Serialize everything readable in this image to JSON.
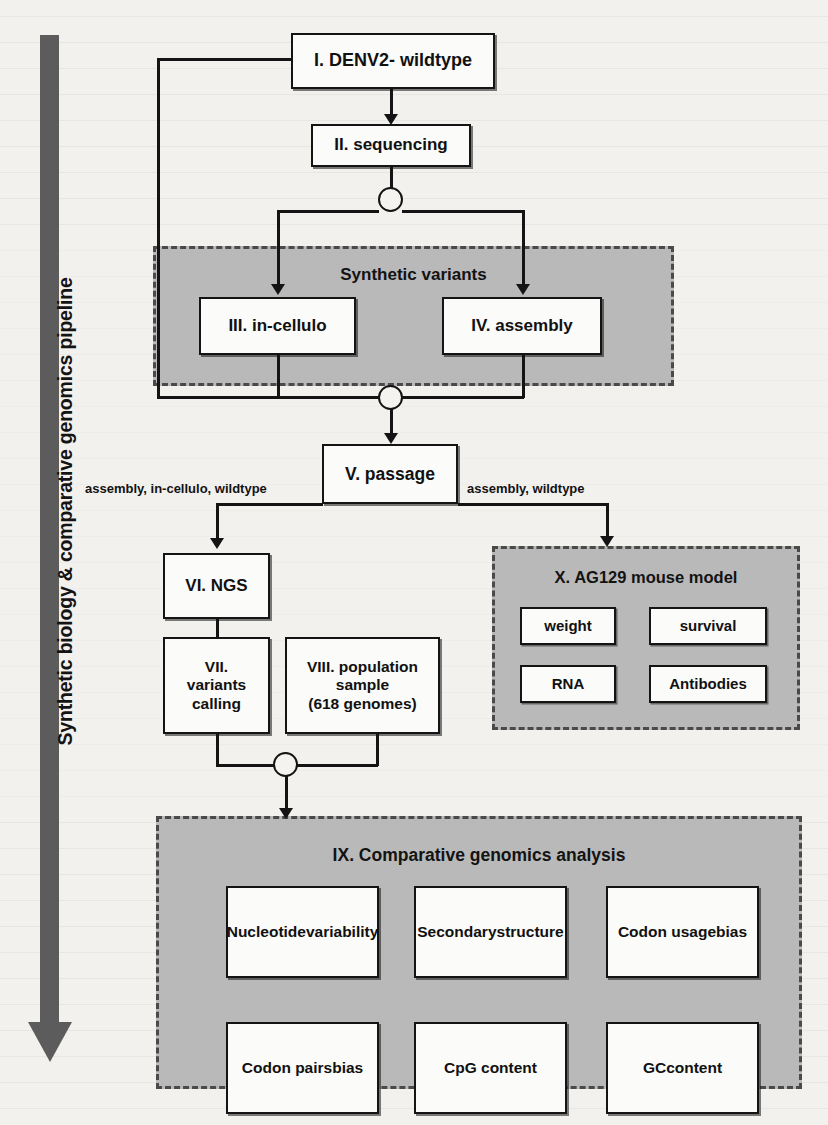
{
  "figure": {
    "pipeline_label": "Synthetic biology & comparative genomics pipeline"
  },
  "nodes": {
    "n1": "I. DENV2- wildtype",
    "n2": "II. sequencing",
    "n3": "III. in-cellulo",
    "n4": "IV. assembly",
    "n5": "V. passage",
    "n6": "VI. NGS",
    "n7": "VII.\nvariants\ncalling",
    "n7_lines": [
      "VII.",
      "variants",
      "calling"
    ],
    "n8_lines": [
      "VIII. population",
      "sample",
      "(618 genomes)"
    ]
  },
  "groups": {
    "synthetic_variants": {
      "title": "Synthetic variants"
    },
    "mouse_model": {
      "title": "X. AG129 mouse model",
      "items": [
        "weight",
        "survival",
        "RNA",
        "Antibodies"
      ]
    },
    "comparative_genomics": {
      "title": "IX. Comparative genomics analysis",
      "items": [
        "Nucleotide\nvariability",
        "Secondary\nstructure",
        "Codon usage\nbias",
        "Codon pairs\nbias",
        "CpG content",
        "GCcontent"
      ],
      "items_lines": [
        [
          "Nucleotide",
          "variability"
        ],
        [
          "Secondary",
          "structure"
        ],
        [
          "Codon usage",
          "bias"
        ],
        [
          "Codon pairs",
          "bias"
        ],
        [
          "CpG content",
          ""
        ],
        [
          "GCcontent",
          ""
        ]
      ]
    }
  },
  "edge_labels": {
    "left": "assembly, in-cellulo, wildtype",
    "right": "assembly, wildtype"
  },
  "colors": {
    "panel_gray": "#b9b9b9",
    "stroke": "#141414",
    "arrow_gray": "#5c5c5c",
    "page": "#f2f1ee",
    "box_fill": "#fbfbf9"
  }
}
